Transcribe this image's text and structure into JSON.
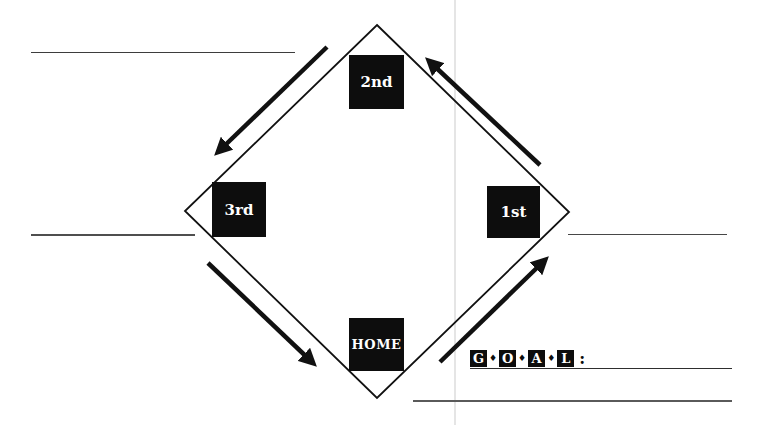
{
  "bases": {
    "second": {
      "label": "2nd"
    },
    "third": {
      "label": "3rd"
    },
    "first": {
      "label": "1st"
    },
    "home": {
      "label": "HOME"
    }
  },
  "goal": {
    "letters": [
      "G",
      "O",
      "A",
      "L"
    ],
    "separator": "♦",
    "colon": ":"
  },
  "icons": {
    "arrow_first_to_second": "diagonal-arrow-up-left",
    "arrow_second_to_third": "diagonal-arrow-down-left",
    "arrow_third_to_home": "diagonal-arrow-down-right",
    "arrow_home_to_first": "diagonal-arrow-up-right"
  },
  "colors": {
    "ink": "#111111",
    "base_bg": "#0d0d0d",
    "base_text": "#ffffff",
    "blank_line": "#4a4a4a",
    "artifact_line": "#d9d9d9"
  }
}
